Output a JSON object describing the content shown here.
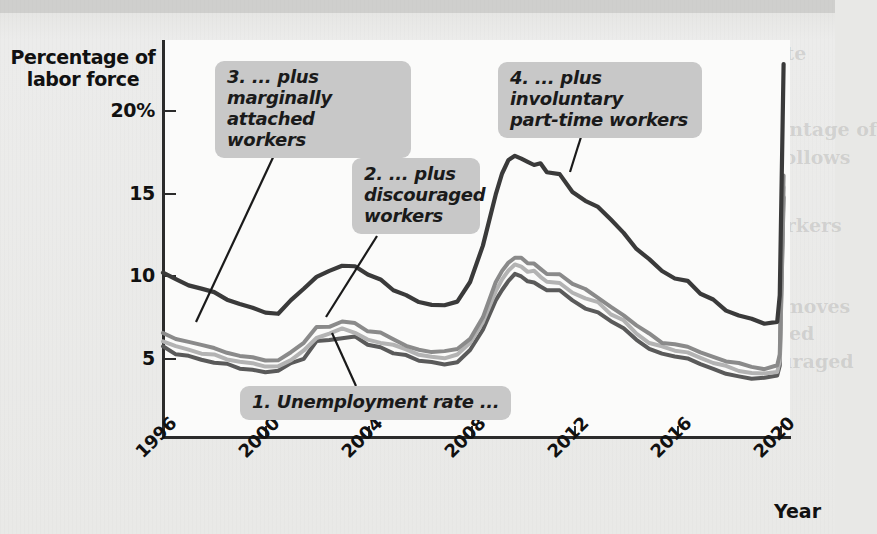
{
  "figure": {
    "y_axis_title_line1": "Percentage of",
    "y_axis_title_line2": "labor force",
    "x_axis_title": "Year"
  },
  "callouts": [
    {
      "id": "c1",
      "text": "1. Unemployment rate ...",
      "lines": [
        "1. Unemployment rate ..."
      ]
    },
    {
      "id": "c2",
      "text": "2. ... plus discouraged workers",
      "lines": [
        "2. ... plus",
        "discouraged",
        "workers"
      ]
    },
    {
      "id": "c3",
      "text": "3. ... plus marginally attached workers",
      "lines": [
        "3. ... plus marginally",
        "attached workers"
      ]
    },
    {
      "id": "c4",
      "text": "4. ... plus involuntary part-time workers",
      "lines": [
        "4. ... plus involuntary",
        "part-time workers"
      ]
    }
  ],
  "colors": {
    "series_u3": "#5a5a5a",
    "series_u4": "#b3b3b3",
    "series_u5": "#8a8a8a",
    "series_u6": "#3a3a3a",
    "callout_bg": "#c8c8c8",
    "axis": "#2b2b2b",
    "panel_bg": "#fbfbfa",
    "page_bg": "#e9e9e7"
  },
  "chart_data": {
    "type": "line",
    "title": "",
    "xlabel": "Year",
    "ylabel": "Percentage of labor force",
    "xlim": [
      1996,
      2020.5
    ],
    "ylim": [
      0,
      24
    ],
    "ytick_labels": [
      "20%",
      "15",
      "10",
      "5"
    ],
    "yticks": [
      20,
      15,
      10,
      5
    ],
    "xticks": [
      1996,
      2000,
      2004,
      2008,
      2012,
      2016,
      2020
    ],
    "xtick_labels": [
      "1996",
      "2000",
      "2004",
      "2008",
      "2012",
      "2016",
      "2020"
    ],
    "grid": false,
    "legend": "callout-annotations",
    "x": [
      1996,
      1996.5,
      1997,
      1997.5,
      1998,
      1998.5,
      1999,
      1999.5,
      2000,
      2000.5,
      2001,
      2001.5,
      2002,
      2002.5,
      2003,
      2003.5,
      2004,
      2004.5,
      2005,
      2005.5,
      2006,
      2006.5,
      2007,
      2007.5,
      2008,
      2008.5,
      2009,
      2009.25,
      2009.5,
      2009.75,
      2010,
      2010.25,
      2010.5,
      2010.75,
      2011,
      2011.5,
      2012,
      2012.5,
      2013,
      2013.5,
      2014,
      2014.5,
      2015,
      2015.5,
      2016,
      2016.5,
      2017,
      2017.5,
      2018,
      2018.5,
      2019,
      2019.5,
      2020,
      2020.1,
      2020.25
    ],
    "series": [
      {
        "name": "1. Unemployment rate (U-3)",
        "color": "#5a5a5a",
        "values": [
          5.5,
          5.2,
          5.0,
          4.8,
          4.6,
          4.5,
          4.3,
          4.2,
          4.0,
          4.0,
          4.5,
          4.9,
          5.8,
          5.9,
          6.1,
          6.1,
          5.7,
          5.5,
          5.2,
          5.0,
          4.7,
          4.6,
          4.5,
          4.7,
          5.4,
          6.6,
          8.5,
          9.1,
          9.6,
          9.9,
          9.8,
          9.6,
          9.5,
          9.3,
          9.0,
          8.9,
          8.3,
          7.9,
          7.6,
          7.1,
          6.6,
          6.0,
          5.5,
          5.1,
          4.9,
          4.9,
          4.5,
          4.3,
          4.0,
          3.8,
          3.7,
          3.6,
          3.8,
          4.4,
          14.7
        ]
      },
      {
        "name": "2. ... plus discouraged workers (U-4)",
        "color": "#b3b3b3",
        "values": [
          5.9,
          5.6,
          5.4,
          5.2,
          5.0,
          4.8,
          4.6,
          4.5,
          4.3,
          4.3,
          4.8,
          5.3,
          6.2,
          6.3,
          6.6,
          6.5,
          6.1,
          5.9,
          5.6,
          5.3,
          5.0,
          4.9,
          4.8,
          5.0,
          5.7,
          7.0,
          9.0,
          9.6,
          10.2,
          10.5,
          10.4,
          10.2,
          10.1,
          9.9,
          9.6,
          9.5,
          8.9,
          8.5,
          8.2,
          7.6,
          7.1,
          6.4,
          5.9,
          5.5,
          5.3,
          5.2,
          4.8,
          4.6,
          4.3,
          4.1,
          4.0,
          3.9,
          4.1,
          4.7,
          15.3
        ]
      },
      {
        "name": "3. ... plus marginally attached workers (U-5)",
        "color": "#8a8a8a",
        "values": [
          6.3,
          6.0,
          5.8,
          5.6,
          5.4,
          5.2,
          5.0,
          4.9,
          4.7,
          4.7,
          5.2,
          5.7,
          6.7,
          6.8,
          7.1,
          7.0,
          6.6,
          6.4,
          6.0,
          5.7,
          5.4,
          5.3,
          5.2,
          5.4,
          6.1,
          7.4,
          9.5,
          10.1,
          10.7,
          11.0,
          10.9,
          10.7,
          10.6,
          10.4,
          10.1,
          10.0,
          9.4,
          9.0,
          8.6,
          8.0,
          7.5,
          6.8,
          6.3,
          5.9,
          5.7,
          5.6,
          5.2,
          5.0,
          4.7,
          4.5,
          4.4,
          4.3,
          4.5,
          5.1,
          16.0
        ]
      },
      {
        "name": "4. ... plus involuntary part-time workers (U-6)",
        "color": "#3a3a3a",
        "values": [
          10.0,
          9.7,
          9.4,
          9.1,
          8.8,
          8.5,
          8.2,
          7.9,
          7.6,
          7.5,
          8.3,
          9.1,
          9.9,
          10.1,
          10.4,
          10.4,
          9.9,
          9.6,
          9.1,
          8.7,
          8.3,
          8.2,
          8.1,
          8.4,
          9.6,
          11.8,
          14.9,
          16.2,
          16.9,
          17.2,
          17.1,
          16.8,
          16.7,
          16.8,
          16.2,
          16.0,
          15.0,
          14.5,
          14.0,
          13.3,
          12.4,
          11.6,
          10.9,
          10.2,
          9.8,
          9.5,
          8.8,
          8.4,
          7.8,
          7.4,
          7.2,
          6.9,
          7.0,
          8.7,
          22.8
        ]
      }
    ],
    "annotations": [
      {
        "label": "1. Unemployment rate ...",
        "points_to_series": "U-3",
        "at_x": 2004.6
      },
      {
        "label": "2. ... plus discouraged workers",
        "points_to_series": "U-4",
        "at_x": 2003.2
      },
      {
        "label": "3. ... plus marginally attached workers",
        "points_to_series": "U-5",
        "at_x": 1997.5
      },
      {
        "label": "4. ... plus involuntary part-time workers",
        "points_to_series": "U-6",
        "at_x": 2010.4
      }
    ]
  }
}
